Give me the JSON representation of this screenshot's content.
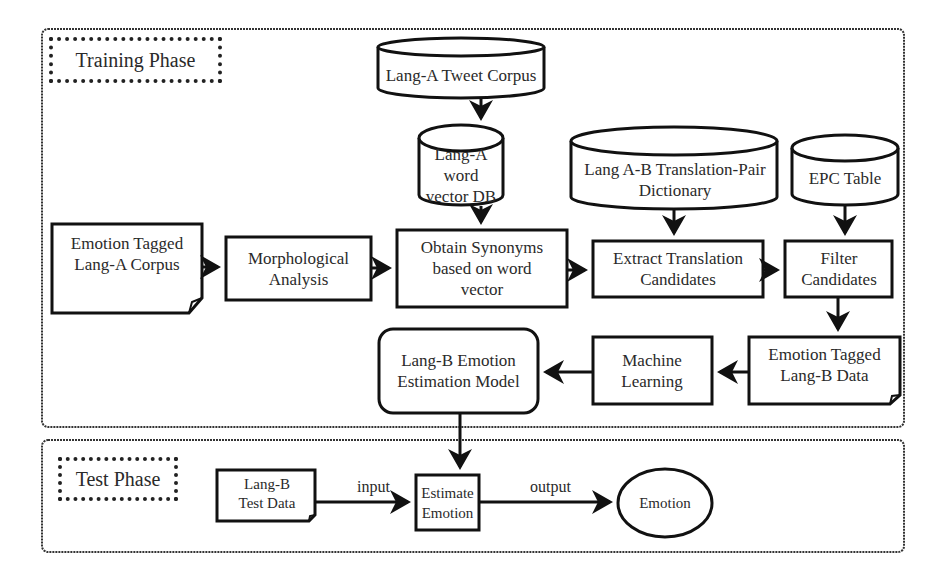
{
  "diagram": {
    "training_phase": {
      "title": "Training Phase",
      "nodes": {
        "tweet_corpus": "Lang-A Tweet Corpus",
        "word_vector_db": "Lang-A word vector DB",
        "dictionary": "Lang A-B Translation-Pair Dictionary",
        "epc_table": "EPC Table",
        "tagged_corpus": "Emotion Tagged Lang-A Corpus",
        "morph": "Morphological Analysis",
        "synonyms": "Obtain Synonyms based on word vector",
        "extract": "Extract Translation Candidates",
        "filter": "Filter Candidates",
        "tagged_b": "Emotion Tagged Lang-B Data",
        "ml": "Machine Learning",
        "model": "Lang-B Emotion Estimation Model"
      }
    },
    "test_phase": {
      "title": "Test Phase",
      "nodes": {
        "test_data": "Lang-B Test Data",
        "estimate": "Estimate Emotion",
        "emotion": "Emotion"
      },
      "edges": {
        "input": "input",
        "output": "output"
      }
    },
    "edges": [
      {
        "from": "tweet_corpus",
        "to": "word_vector_db"
      },
      {
        "from": "word_vector_db",
        "to": "synonyms"
      },
      {
        "from": "dictionary",
        "to": "extract"
      },
      {
        "from": "epc_table",
        "to": "filter"
      },
      {
        "from": "tagged_corpus",
        "to": "morph"
      },
      {
        "from": "morph",
        "to": "synonyms"
      },
      {
        "from": "synonyms",
        "to": "extract"
      },
      {
        "from": "extract",
        "to": "filter"
      },
      {
        "from": "filter",
        "to": "tagged_b"
      },
      {
        "from": "tagged_b",
        "to": "ml"
      },
      {
        "from": "ml",
        "to": "model"
      },
      {
        "from": "model",
        "to": "estimate"
      },
      {
        "from": "test_data",
        "to": "estimate",
        "label": "input"
      },
      {
        "from": "estimate",
        "to": "emotion",
        "label": "output"
      }
    ]
  }
}
